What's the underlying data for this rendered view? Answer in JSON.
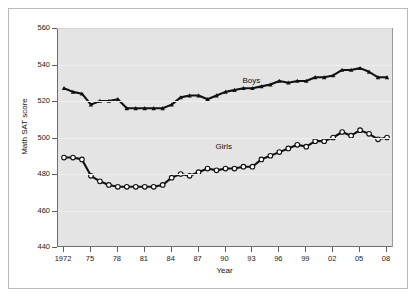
{
  "chart_data": {
    "type": "line",
    "title": "",
    "xlabel": "Year",
    "ylabel": "Math SAT score",
    "xlim": [
      1972,
      2008
    ],
    "ylim": [
      440,
      560
    ],
    "yticks": [
      440,
      460,
      480,
      500,
      520,
      540,
      560
    ],
    "ytick_labels": [
      "440",
      "460",
      "480",
      "500",
      "520",
      "540",
      "560"
    ],
    "xticks": [
      1972,
      1975,
      1978,
      1981,
      1984,
      1987,
      1990,
      1993,
      1996,
      1999,
      2002,
      2005,
      2008
    ],
    "xtick_labels": [
      "1972",
      "75",
      "78",
      "81",
      "84",
      "87",
      "90",
      "93",
      "96",
      "99",
      "02",
      "05",
      "08"
    ],
    "grid": true,
    "legend": "inline-annotations",
    "x": [
      1972,
      1973,
      1974,
      1975,
      1976,
      1977,
      1978,
      1979,
      1980,
      1981,
      1982,
      1983,
      1984,
      1985,
      1986,
      1987,
      1988,
      1989,
      1990,
      1991,
      1992,
      1993,
      1994,
      1995,
      1996,
      1997,
      1998,
      1999,
      2000,
      2001,
      2002,
      2003,
      2004,
      2005,
      2006,
      2007,
      2008
    ],
    "series": [
      {
        "name": "Boys",
        "marker": "filled-triangle",
        "color": "#111111",
        "label_x": 1992,
        "label_y": 531,
        "values": [
          527,
          525,
          524,
          518,
          520,
          520,
          521,
          516,
          516,
          516,
          516,
          516,
          518,
          522,
          523,
          523,
          521,
          523,
          525,
          526,
          527,
          527,
          528,
          529,
          531,
          530,
          531,
          531,
          533,
          533,
          534,
          537,
          537,
          538,
          536,
          533,
          533
        ]
      },
      {
        "name": "Girls",
        "marker": "open-circle",
        "color": "#111111",
        "label_x": 1989,
        "label_y": 495,
        "values": [
          489,
          489,
          488,
          479,
          476,
          474,
          473,
          473,
          473,
          473,
          473,
          474,
          478,
          480,
          479,
          481,
          483,
          482,
          483,
          483,
          484,
          484,
          488,
          490,
          492,
          494,
          496,
          495,
          498,
          498,
          500,
          503,
          501,
          504,
          502,
          499,
          500
        ]
      }
    ]
  }
}
